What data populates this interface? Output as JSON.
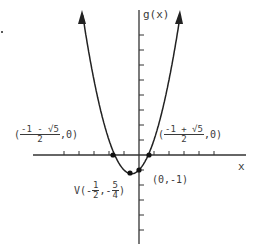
{
  "chart_data": {
    "type": "line",
    "title": "",
    "function": "g(x) = x^2 + x - 1",
    "xlabel": "x",
    "ylabel": "g(x)",
    "xlim": [
      -7,
      7
    ],
    "ylim": [
      -5.5,
      9.5
    ],
    "grid": false,
    "x_ticks_unit": 1,
    "y_ticks_unit": 1,
    "points": [
      {
        "name": "left-root",
        "x": -1.618,
        "y": 0,
        "label": "(-1 - √5)/2, 0"
      },
      {
        "name": "right-root",
        "x": 0.618,
        "y": 0,
        "label": "(-1 + √5)/2, 0"
      },
      {
        "name": "vertex",
        "x": -0.5,
        "y": -1.25,
        "label": "V(-1/2, -5/4)"
      },
      {
        "name": "y-intercept",
        "x": 0,
        "y": -1,
        "label": "(0,-1)"
      }
    ]
  },
  "labels": {
    "ylabel": "g(x)",
    "xlabel": "x",
    "left_root": {
      "open": "(",
      "num": "-1 - √5",
      "den": "2",
      "close": ",0)"
    },
    "right_root": {
      "open": "(",
      "num": "-1 + √5",
      "den": "2",
      "close": ",0)"
    },
    "vertex": {
      "prefix": "V(-",
      "num1": "1",
      "den1": "2",
      "mid": ",-",
      "num2": "5",
      "den2": "4",
      "close": ")"
    },
    "y_intercept": "(0,-1)"
  }
}
